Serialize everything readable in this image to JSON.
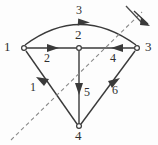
{
  "figure": {
    "type": "directed-graph-diagram",
    "background_color": "#fdfdfd",
    "line_color": "#3a3a3a",
    "dash_color": "#8a8a8a",
    "text_color": "#2f2f2f"
  },
  "nodes": [
    {
      "id": "n1",
      "label": "1",
      "x": 24,
      "y": 48,
      "label_x": 7,
      "label_y": 41
    },
    {
      "id": "n2",
      "label": "2",
      "x": 79,
      "y": 48,
      "label_x": 75,
      "label_y": 30
    },
    {
      "id": "n3",
      "label": "3",
      "x": 137,
      "y": 48,
      "label_x": 145,
      "label_y": 41
    },
    {
      "id": "n4",
      "label": "4",
      "x": 79,
      "y": 126,
      "label_x": 75,
      "label_y": 130
    }
  ],
  "edges": [
    {
      "id": "e3",
      "label": "3",
      "from": "n1",
      "to": "n3",
      "shape": "arc",
      "direction": "left-to-right",
      "label_x": 76,
      "label_y": 7
    },
    {
      "id": "e2",
      "label": "2",
      "from": "n1",
      "to": "n2",
      "shape": "straight",
      "direction": "left-to-right",
      "label_x": 44,
      "label_y": 54
    },
    {
      "id": "e4",
      "label": "4",
      "from": "n3",
      "to": "n2",
      "shape": "straight",
      "direction": "right-to-left",
      "label_x": 110,
      "label_y": 54
    },
    {
      "id": "e1",
      "label": "1",
      "from": "n4",
      "to": "n1",
      "shape": "straight",
      "direction": "up-left",
      "label_x": 32,
      "label_y": 85
    },
    {
      "id": "e5",
      "label": "5",
      "from": "n2",
      "to": "n4",
      "shape": "straight",
      "direction": "downward",
      "label_x": 84,
      "label_y": 89
    },
    {
      "id": "e6",
      "label": "6",
      "from": "n4",
      "to": "n3",
      "shape": "straight",
      "direction": "up-right",
      "label_x": 113,
      "label_y": 87
    }
  ],
  "cut_line": {
    "style": "dashed",
    "from_x": 11,
    "from_y": 140,
    "to_x": 146,
    "to_y": 8,
    "has_arrow": true,
    "has_tick": true
  }
}
